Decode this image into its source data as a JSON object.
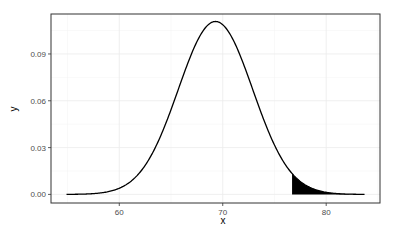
{
  "chart_data": {
    "type": "area",
    "title": "",
    "xlabel": "x",
    "ylabel": "y",
    "distribution": "normal",
    "mean": 69.3,
    "sd": 3.6,
    "x_range": [
      54.9,
      83.7
    ],
    "xlim": [
      53.4,
      85.2
    ],
    "ylim": [
      -0.0055,
      0.1156
    ],
    "x_ticks": [
      60,
      70,
      80
    ],
    "x_tick_labels": [
      "60",
      "70",
      "80"
    ],
    "y_ticks": [
      0.0,
      0.03,
      0.06,
      0.09
    ],
    "y_tick_labels": [
      "0.00",
      "0.03",
      "0.06",
      "0.09"
    ],
    "shaded_region": {
      "from": 76.7,
      "to": 83.7,
      "fill": "#000000"
    },
    "line_color": "#000000",
    "grid": true,
    "theme": "bw"
  }
}
